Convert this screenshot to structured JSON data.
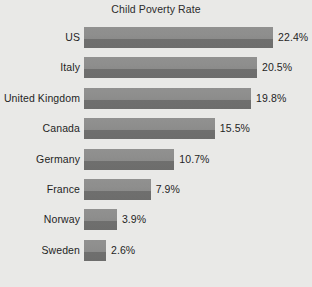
{
  "chart_data": {
    "type": "bar",
    "orientation": "horizontal",
    "title": "Child Poverty Rate",
    "xlabel": "",
    "ylabel": "",
    "categories": [
      "US",
      "Italy",
      "United Kingdom",
      "Canada",
      "Germany",
      "France",
      "Norway",
      "Sweden"
    ],
    "values": [
      22.4,
      20.5,
      19.8,
      15.5,
      10.7,
      7.9,
      3.9,
      2.6
    ],
    "value_labels": [
      "22.4%",
      "20.5%",
      "19.8%",
      "15.5%",
      "10.7%",
      "7.9%",
      "3.9%",
      "2.6%"
    ],
    "xlim": [
      0,
      22.4
    ],
    "grid": false,
    "legend": null,
    "colors": {
      "background": "#e9e9e7",
      "bar_top": "#8e8e8d",
      "bar_bottom": "#6d6d6c",
      "text": "#1f1f1f"
    }
  }
}
